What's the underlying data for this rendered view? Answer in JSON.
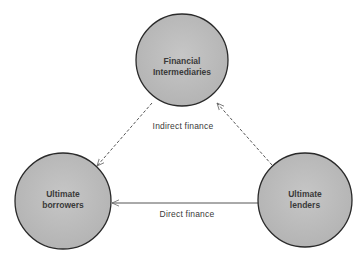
{
  "diagram": {
    "nodes": [
      {
        "id": "intermediaries",
        "line1": "Financial",
        "line2": "Intermediaries",
        "cx": 182,
        "cy": 60,
        "r": 46
      },
      {
        "id": "borrowers",
        "line1": "Ultimate",
        "line2": "borrowers",
        "cx": 63,
        "cy": 201,
        "r": 48
      },
      {
        "id": "lenders",
        "line1": "Ultimate",
        "line2": "lenders",
        "cx": 305,
        "cy": 200,
        "r": 47
      }
    ],
    "edges": [
      {
        "from": "lenders",
        "to": "intermediaries",
        "style": "dashed",
        "label": ""
      },
      {
        "from": "intermediaries",
        "to": "borrowers",
        "style": "dashed",
        "label": ""
      },
      {
        "from": "lenders",
        "to": "borrowers",
        "style": "solid",
        "label": "Direct finance"
      }
    ],
    "labels": {
      "indirect": "Indirect finance",
      "direct": "Direct finance"
    },
    "colors": {
      "node_fill": "#bdbdbd",
      "node_stroke": "#2a2a2a",
      "edge": "#555555",
      "text": "#3a3a3a"
    }
  }
}
